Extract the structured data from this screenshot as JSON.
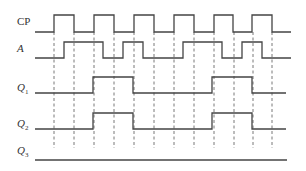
{
  "diagram": {
    "type": "timing-diagram",
    "colors": {
      "signal": "#444444",
      "guide": "#555555",
      "label": "#333333",
      "background": "#ffffff"
    },
    "x_start": 35,
    "x_end": 290,
    "guide_lines": {
      "x": [
        54,
        74,
        94,
        114,
        134,
        154,
        174,
        194,
        214,
        234,
        253,
        272
      ],
      "y_top": 32,
      "y_bottom": 148,
      "style": "dashed"
    },
    "signals": [
      {
        "id": "cp",
        "label": "CP",
        "subscript": "",
        "italic": false,
        "label_y": 25,
        "y_low": 32,
        "y_high": 15,
        "initial": 0,
        "x_end": 291,
        "transitions": [
          54,
          74,
          94,
          114,
          134,
          154,
          174,
          194,
          214,
          233,
          252,
          272
        ]
      },
      {
        "id": "a",
        "label": "A",
        "subscript": "",
        "italic": true,
        "label_y": 52,
        "y_low": 58,
        "y_high": 42,
        "initial": 0,
        "x_end": 291,
        "transitions": [
          64,
          103,
          123,
          143,
          183,
          222,
          242,
          262
        ]
      },
      {
        "id": "q1",
        "label": "Q",
        "subscript": "1",
        "italic": true,
        "label_y": 91,
        "y_low": 93,
        "y_high": 77,
        "initial": 0,
        "x_end": 286,
        "transitions": [
          93,
          133,
          212,
          252
        ]
      },
      {
        "id": "q2",
        "label": "Q",
        "subscript": "2",
        "italic": true,
        "label_y": 127,
        "y_low": 129,
        "y_high": 113,
        "initial": 0,
        "x_end": 286,
        "transitions": [
          93,
          133,
          212,
          252
        ]
      },
      {
        "id": "q3",
        "label": "Q",
        "subscript": "3",
        "italic": true,
        "label_y": 154,
        "y_low": 160,
        "y_high": 144,
        "initial": 0,
        "x_end": 287,
        "transitions": []
      }
    ]
  }
}
